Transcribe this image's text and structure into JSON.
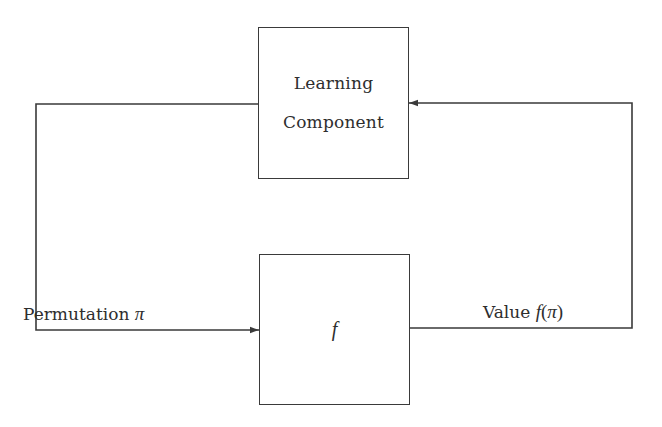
{
  "diagram": {
    "type": "feedback-loop-block-diagram",
    "nodes": [
      {
        "id": "learning-component",
        "label_lines": [
          "Learning",
          "Component"
        ]
      },
      {
        "id": "f",
        "label": "f"
      }
    ],
    "edges": [
      {
        "from": "learning-component",
        "to": "f",
        "label_text": "Permutation",
        "label_symbol": "π"
      },
      {
        "from": "f",
        "to": "learning-component",
        "label_text": "Value",
        "label_func": "f",
        "label_open": "(",
        "label_symbol": "π",
        "label_close": ")"
      }
    ],
    "colors": {
      "line": "#3a3a3a",
      "text": "#2e2e2e",
      "background": "#ffffff"
    }
  }
}
